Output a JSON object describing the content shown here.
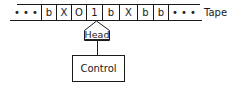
{
  "diagram": {
    "tape": {
      "label": "Tape",
      "left_ellipsis": "• • •",
      "right_ellipsis": "• • •",
      "cells": [
        "b",
        "X",
        "O",
        "1",
        "b",
        "X",
        "b",
        "b"
      ],
      "head_position_index": 3
    },
    "head": {
      "label": "Head"
    },
    "control": {
      "label": "Control"
    },
    "colors": {
      "stroke": "#1a1a1a",
      "background": "#ffffff"
    }
  }
}
